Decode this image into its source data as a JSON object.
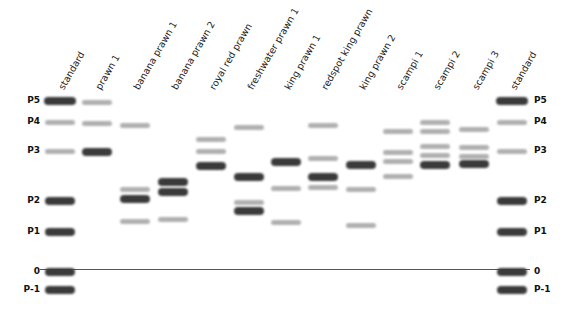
{
  "diagram": {
    "type": "gel-electrophoresis",
    "lanes": [
      {
        "label": "standard",
        "x": 60,
        "bands": [
          {
            "y": 101,
            "i": "dark",
            "w": 32
          },
          {
            "y": 122,
            "i": "light"
          },
          {
            "y": 151,
            "i": "light"
          },
          {
            "y": 201,
            "i": "dark"
          },
          {
            "y": 232,
            "i": "dark"
          },
          {
            "y": 272,
            "i": "dark"
          },
          {
            "y": 290,
            "i": "dark"
          }
        ]
      },
      {
        "label": "prawn 1",
        "x": 97,
        "bands": [
          {
            "y": 102,
            "i": "light"
          },
          {
            "y": 123,
            "i": "light"
          },
          {
            "y": 152,
            "i": "dark"
          }
        ]
      },
      {
        "label": "banana prawn 1",
        "x": 135,
        "bands": [
          {
            "y": 125,
            "i": "light"
          },
          {
            "y": 189,
            "i": "light"
          },
          {
            "y": 199,
            "i": "dark"
          },
          {
            "y": 221,
            "i": "light"
          }
        ]
      },
      {
        "label": "banana prawn 2",
        "x": 173,
        "bands": [
          {
            "y": 182,
            "i": "dark"
          },
          {
            "y": 192,
            "i": "dark"
          },
          {
            "y": 219,
            "i": "light"
          }
        ]
      },
      {
        "label": "royal red prawn",
        "x": 211,
        "bands": [
          {
            "y": 139,
            "i": "light"
          },
          {
            "y": 151,
            "i": "light"
          },
          {
            "y": 166,
            "i": "dark"
          }
        ]
      },
      {
        "label": "freshwater prawn 1",
        "x": 249,
        "bands": [
          {
            "y": 127,
            "i": "light"
          },
          {
            "y": 177,
            "i": "dark"
          },
          {
            "y": 202,
            "i": "light"
          },
          {
            "y": 211,
            "i": "dark"
          }
        ]
      },
      {
        "label": "king prawn 1",
        "x": 286,
        "bands": [
          {
            "y": 162,
            "i": "dark"
          },
          {
            "y": 188,
            "i": "light"
          },
          {
            "y": 222,
            "i": "light"
          }
        ]
      },
      {
        "label": "redspot king prawn",
        "x": 323,
        "bands": [
          {
            "y": 125,
            "i": "light"
          },
          {
            "y": 158,
            "i": "light"
          },
          {
            "y": 177,
            "i": "dark"
          },
          {
            "y": 187,
            "i": "light"
          }
        ]
      },
      {
        "label": "king prawn 2",
        "x": 361,
        "bands": [
          {
            "y": 165,
            "i": "dark"
          },
          {
            "y": 189,
            "i": "light"
          },
          {
            "y": 225,
            "i": "light"
          }
        ]
      },
      {
        "label": "scampi 1",
        "x": 398,
        "bands": [
          {
            "y": 131,
            "i": "light"
          },
          {
            "y": 152,
            "i": "light"
          },
          {
            "y": 161,
            "i": "light"
          },
          {
            "y": 176,
            "i": "light"
          }
        ]
      },
      {
        "label": "scampi 2",
        "x": 435,
        "bands": [
          {
            "y": 122,
            "i": "light"
          },
          {
            "y": 131,
            "i": "light"
          },
          {
            "y": 146,
            "i": "light"
          },
          {
            "y": 155,
            "i": "light"
          },
          {
            "y": 165,
            "i": "dark"
          }
        ]
      },
      {
        "label": "scampi 3",
        "x": 474,
        "bands": [
          {
            "y": 129,
            "i": "light"
          },
          {
            "y": 147,
            "i": "light"
          },
          {
            "y": 156,
            "i": "light"
          },
          {
            "y": 164,
            "i": "dark"
          }
        ]
      },
      {
        "label": "standard",
        "x": 512,
        "bands": [
          {
            "y": 101,
            "i": "dark",
            "w": 32
          },
          {
            "y": 122,
            "i": "light"
          },
          {
            "y": 151,
            "i": "light"
          },
          {
            "y": 201,
            "i": "dark"
          },
          {
            "y": 232,
            "i": "dark"
          },
          {
            "y": 272,
            "i": "dark"
          },
          {
            "y": 290,
            "i": "dark"
          }
        ]
      }
    ],
    "markers_left": [
      {
        "label": "P5",
        "y": 101
      },
      {
        "label": "P4",
        "y": 122
      },
      {
        "label": "P3",
        "y": 151
      },
      {
        "label": "P2",
        "y": 201
      },
      {
        "label": "P1",
        "y": 232
      },
      {
        "label": "0",
        "y": 272
      },
      {
        "label": "P-1",
        "y": 290
      }
    ],
    "markers_right": [
      {
        "label": "P5",
        "y": 101
      },
      {
        "label": "P4",
        "y": 122
      },
      {
        "label": "P3",
        "y": 151
      },
      {
        "label": "P2",
        "y": 201
      },
      {
        "label": "P1",
        "y": 232
      },
      {
        "label": "0",
        "y": 272
      },
      {
        "label": "P-1",
        "y": 290
      }
    ],
    "baseline": {
      "y": 269,
      "x1": 40,
      "x2": 530,
      "label": "0"
    },
    "colors": {
      "dark_band": "#3a3a3a",
      "light_band": "#b0b0b0",
      "baseline": "#555555",
      "text": "#222222"
    }
  }
}
